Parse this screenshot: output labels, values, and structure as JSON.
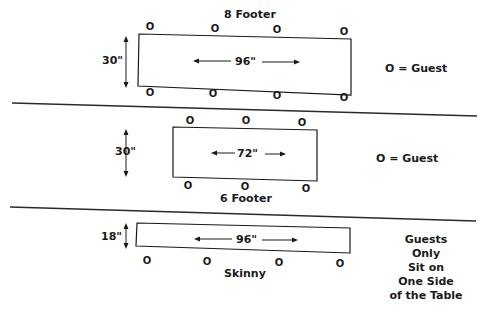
{
  "diagram": {
    "colors": {
      "ink": "#1a1a1a",
      "background": "#ffffff"
    },
    "guest_symbol": "O",
    "tables": [
      {
        "name": "8 Footer",
        "width_label": "96\"",
        "depth_label": "30\"",
        "legend": "O = Guest",
        "guests_top": [
          "O",
          "O",
          "O",
          "O"
        ],
        "guests_bottom": [
          "O",
          "O",
          "O",
          "O"
        ]
      },
      {
        "name": "6 Footer",
        "width_label": "72\"",
        "depth_label": "30\"",
        "legend": "O = Guest",
        "guests_top": [
          "O",
          "O",
          "O"
        ],
        "guests_bottom": [
          "O",
          "O",
          "O"
        ]
      },
      {
        "name": "Skinny",
        "width_label": "96\"",
        "depth_label": "18\"",
        "note_lines": [
          "Guests",
          "Only",
          "Sit on",
          "One Side",
          "of the Table"
        ],
        "guests_bottom": [
          "O",
          "O",
          "O",
          "O"
        ]
      }
    ]
  }
}
